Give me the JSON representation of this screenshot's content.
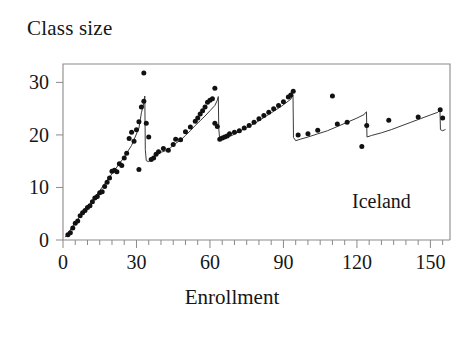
{
  "chart_data": {
    "type": "scatter",
    "title": "",
    "ylabel": "Class size",
    "xlabel": "Enrollment",
    "annotation": "Iceland",
    "xlim": [
      0,
      158
    ],
    "ylim": [
      0,
      33.5
    ],
    "xticks": [
      0,
      30,
      60,
      90,
      120,
      150
    ],
    "xtick_labels": [
      "0",
      "30",
      "60",
      "90",
      "120",
      "150"
    ],
    "xminor_step": 5,
    "yticks": [
      0,
      10,
      20,
      30
    ],
    "ytick_labels": [
      "0",
      "10",
      "20",
      "30"
    ],
    "grid": false,
    "legend": null,
    "series": [
      {
        "name": "Observed average class size",
        "marker": "filled-circle",
        "color": "#111111",
        "points": [
          [
            2,
            1.0
          ],
          [
            3,
            1.4
          ],
          [
            4,
            2.3
          ],
          [
            5,
            3.2
          ],
          [
            6,
            3.6
          ],
          [
            7,
            4.6
          ],
          [
            8,
            5.2
          ],
          [
            9,
            5.6
          ],
          [
            10,
            6.2
          ],
          [
            11,
            6.5
          ],
          [
            12,
            7.3
          ],
          [
            13,
            8.0
          ],
          [
            14,
            8.3
          ],
          [
            15,
            9.0
          ],
          [
            16,
            9.2
          ],
          [
            17,
            10.2
          ],
          [
            18,
            11.0
          ],
          [
            19,
            11.8
          ],
          [
            20,
            13.1
          ],
          [
            21,
            13.3
          ],
          [
            22,
            13.0
          ],
          [
            23,
            14.5
          ],
          [
            24,
            14.2
          ],
          [
            25,
            15.6
          ],
          [
            26,
            16.5
          ],
          [
            27,
            19.3
          ],
          [
            28,
            20.5
          ],
          [
            29,
            18.8
          ],
          [
            30,
            21.0
          ],
          [
            31,
            22.5
          ],
          [
            31,
            13.4
          ],
          [
            32,
            25.3
          ],
          [
            33,
            26.4
          ],
          [
            33,
            31.8
          ],
          [
            34,
            22.2
          ],
          [
            35,
            19.6
          ],
          [
            36,
            15.3
          ],
          [
            37,
            15.6
          ],
          [
            38,
            16.3
          ],
          [
            39,
            16.8
          ],
          [
            41,
            17.4
          ],
          [
            43,
            17.1
          ],
          [
            45,
            18.2
          ],
          [
            46,
            19.2
          ],
          [
            48,
            19.1
          ],
          [
            50,
            20.6
          ],
          [
            52,
            21.5
          ],
          [
            54,
            22.6
          ],
          [
            55,
            23.2
          ],
          [
            56,
            24.0
          ],
          [
            57,
            24.6
          ],
          [
            58,
            25.3
          ],
          [
            59,
            26.2
          ],
          [
            60,
            26.6
          ],
          [
            61,
            26.9
          ],
          [
            62,
            28.9
          ],
          [
            62,
            22.2
          ],
          [
            63,
            21.6
          ],
          [
            64,
            19.2
          ],
          [
            65,
            19.4
          ],
          [
            66,
            19.6
          ],
          [
            67,
            19.8
          ],
          [
            68,
            20.2
          ],
          [
            70,
            20.5
          ],
          [
            72,
            20.8
          ],
          [
            74,
            21.3
          ],
          [
            76,
            21.8
          ],
          [
            78,
            22.4
          ],
          [
            80,
            23.1
          ],
          [
            82,
            23.7
          ],
          [
            84,
            24.3
          ],
          [
            86,
            25.0
          ],
          [
            88,
            25.6
          ],
          [
            90,
            26.3
          ],
          [
            92,
            27.2
          ],
          [
            93,
            27.6
          ],
          [
            94,
            28.3
          ],
          [
            96,
            20.0
          ],
          [
            100,
            20.2
          ],
          [
            104,
            20.9
          ],
          [
            110,
            27.4
          ],
          [
            112,
            22.1
          ],
          [
            116,
            22.4
          ],
          [
            122,
            17.8
          ],
          [
            124,
            21.8
          ],
          [
            133,
            22.8
          ],
          [
            145,
            23.4
          ],
          [
            154,
            24.8
          ],
          [
            155,
            23.2
          ]
        ]
      },
      {
        "name": "Maimonides rule fitted class size",
        "type": "line",
        "color": "#3a3a3a",
        "points": [
          [
            1,
            0.6
          ],
          [
            5,
            3.3
          ],
          [
            10,
            6.2
          ],
          [
            15,
            9.4
          ],
          [
            20,
            12.6
          ],
          [
            25,
            15.8
          ],
          [
            28,
            18.0
          ],
          [
            31,
            21.3
          ],
          [
            32,
            24.2
          ],
          [
            33,
            26.0
          ],
          [
            33.4,
            27.4
          ],
          [
            33.6,
            17.2
          ],
          [
            34,
            15.1
          ],
          [
            35,
            14.9
          ],
          [
            36,
            15.4
          ],
          [
            38,
            16.2
          ],
          [
            40,
            16.7
          ],
          [
            42,
            17.0
          ],
          [
            44,
            17.6
          ],
          [
            46,
            18.4
          ],
          [
            48,
            19.0
          ],
          [
            50,
            19.9
          ],
          [
            52,
            20.8
          ],
          [
            54,
            21.8
          ],
          [
            56,
            22.7
          ],
          [
            58,
            23.6
          ],
          [
            60,
            24.6
          ],
          [
            62,
            25.6
          ],
          [
            63,
            26.6
          ],
          [
            63.4,
            27.3
          ],
          [
            63.6,
            21.2
          ],
          [
            64,
            19.1
          ],
          [
            65,
            19.1
          ],
          [
            67,
            19.5
          ],
          [
            69,
            19.9
          ],
          [
            71,
            20.4
          ],
          [
            73,
            20.9
          ],
          [
            75,
            21.4
          ],
          [
            77,
            21.9
          ],
          [
            79,
            22.4
          ],
          [
            81,
            23.0
          ],
          [
            83,
            23.6
          ],
          [
            85,
            24.2
          ],
          [
            87,
            24.8
          ],
          [
            89,
            25.4
          ],
          [
            91,
            26.1
          ],
          [
            93,
            26.8
          ],
          [
            93.6,
            27.4
          ],
          [
            93.9,
            27.6
          ],
          [
            94.1,
            19.5
          ],
          [
            95,
            18.9
          ],
          [
            97,
            19.2
          ],
          [
            100,
            19.6
          ],
          [
            104,
            20.2
          ],
          [
            108,
            20.8
          ],
          [
            112,
            21.6
          ],
          [
            116,
            22.4
          ],
          [
            120,
            23.2
          ],
          [
            123,
            23.9
          ],
          [
            123.6,
            24.3
          ],
          [
            123.9,
            24.4
          ],
          [
            124.1,
            19.6
          ],
          [
            126,
            19.9
          ],
          [
            130,
            20.4
          ],
          [
            134,
            21.0
          ],
          [
            138,
            21.7
          ],
          [
            142,
            22.4
          ],
          [
            146,
            23.1
          ],
          [
            150,
            23.8
          ],
          [
            153,
            24.3
          ],
          [
            153.6,
            24.6
          ],
          [
            153.9,
            24.7
          ],
          [
            154.1,
            21.0
          ],
          [
            155,
            20.8
          ],
          [
            156,
            21.0
          ]
        ]
      }
    ]
  },
  "colors": {
    "marker": "#111111",
    "line": "#3a3a3a",
    "axis": "#8a8a8a",
    "text": "#161616",
    "background": "#ffffff"
  }
}
